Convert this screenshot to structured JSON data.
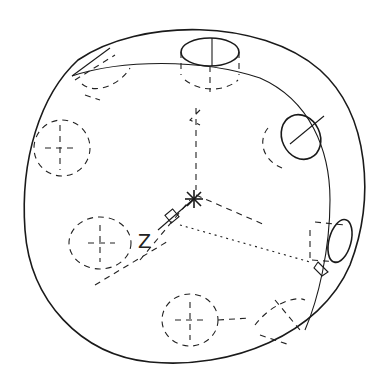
{
  "drawing": {
    "type": "isometric wireframe",
    "subject": "circular flange with bolt holes",
    "axis_label": "Z",
    "colors": {
      "line": "#1a1a1a",
      "background": "#ffffff"
    },
    "icons": [
      "ucs-origin-asterisk-icon",
      "ucs-box-marker-icon"
    ],
    "visible_holes": 3,
    "hidden_holes": 6
  }
}
